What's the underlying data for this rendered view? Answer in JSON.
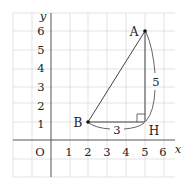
{
  "figure": {
    "axes": {
      "x_label": "x",
      "y_label": "y",
      "origin_label": "O",
      "x_ticks": [
        "1",
        "2",
        "3",
        "4",
        "5",
        "6"
      ],
      "y_ticks": [
        "1",
        "2",
        "3",
        "4",
        "5",
        "6"
      ]
    },
    "points": [
      {
        "label": "A",
        "x": 5,
        "y": 6
      },
      {
        "label": "B",
        "x": 2,
        "y": 1
      },
      {
        "label": "H",
        "x": 5,
        "y": 1
      }
    ],
    "segments": [
      {
        "from": "A",
        "to": "B"
      },
      {
        "from": "B",
        "to": "H"
      },
      {
        "from": "H",
        "to": "A"
      }
    ],
    "measurements": [
      {
        "segment": "BH",
        "value": "3"
      },
      {
        "segment": "AH",
        "value": "5"
      }
    ],
    "right_angle_at": "H",
    "colors": {
      "grid": "#d9d9d9",
      "axis": "#555555",
      "line": "#444444",
      "point": "#111111"
    }
  }
}
